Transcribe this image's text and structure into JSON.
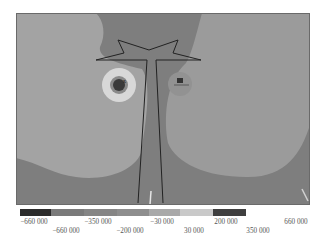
{
  "chart_data": {
    "type": "heatmap",
    "title": "",
    "colorbar": {
      "segments": [
        {
          "from": -660000,
          "to": -350000,
          "color": "#2b2b2b"
        },
        {
          "from": -350000,
          "to": -200000,
          "color": "#7a7a7a"
        },
        {
          "from": -200000,
          "to": -30000,
          "color": "#858585"
        },
        {
          "from": -30000,
          "to": 30000,
          "color": "#8e8e8e"
        },
        {
          "from": 30000,
          "to": 200000,
          "color": "#a9a9a9"
        },
        {
          "from": 200000,
          "to": 350000,
          "color": "#c9c9c9"
        },
        {
          "from": 350000,
          "to": 660000,
          "color": "#3f3f3f"
        }
      ],
      "tick_labels_top": [
        "−660 000",
        "−350 000",
        "−30 000",
        "200 000",
        "660 000"
      ],
      "tick_labels_bottom": [
        "−660 000",
        "−200 000",
        "30 000",
        "350 000"
      ]
    },
    "regions": [
      {
        "name": "background-field",
        "color": "#7d7d7d"
      },
      {
        "name": "left-lobe",
        "color": "#a3a3a3"
      },
      {
        "name": "right-lobe",
        "color": "#999999"
      },
      {
        "name": "left-hole-halo",
        "color": "#d8d8d8"
      },
      {
        "name": "left-hole-core",
        "color": "#3a3a3a"
      },
      {
        "name": "right-hole",
        "color": "#8a8a8a"
      }
    ],
    "markers": [
      {
        "label": "X",
        "near": "left-hole"
      },
      {
        "label": "B",
        "near": "right-hole"
      }
    ]
  }
}
